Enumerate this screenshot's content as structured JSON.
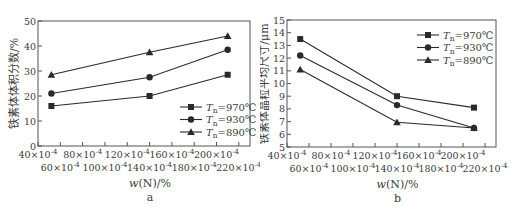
{
  "chart_data": [
    {
      "type": "line",
      "panel_label": "a",
      "title": "",
      "xlabel": "w(N)/%",
      "ylabel": "铁素体体积分数/%",
      "x_ticks": [
        "40×10⁻⁴",
        "60×10⁻⁴",
        "80×10⁻⁴",
        "100×10⁻⁴",
        "120×10⁻⁴",
        "140×10⁻⁴",
        "160×10⁻⁴",
        "180×10⁻⁴",
        "200×10⁻⁴",
        "220×10⁻⁴"
      ],
      "y_ticks": [
        "0",
        "10",
        "20",
        "30",
        "40",
        "50"
      ],
      "xlim": [
        40,
        230
      ],
      "ylim": [
        0,
        50
      ],
      "x": [
        52,
        140,
        210
      ],
      "x_unit": "×10⁻⁴",
      "series": [
        {
          "name": "Tn=970℃",
          "marker": "square",
          "values": [
            16,
            20,
            28.5
          ]
        },
        {
          "name": "Tn=930℃",
          "marker": "circle",
          "values": [
            21,
            27.5,
            38.5
          ]
        },
        {
          "name": "Tn=890℃",
          "marker": "triangle",
          "values": [
            28.5,
            37.5,
            44
          ]
        }
      ],
      "legend_position": "lower right",
      "grid": false
    },
    {
      "type": "line",
      "panel_label": "b",
      "title": "",
      "xlabel": "w(N)/%",
      "ylabel": "铁素体晶粒平均尺寸/μm",
      "x_ticks": [
        "40×10⁻⁴",
        "60×10⁻⁴",
        "80×10⁻⁴",
        "100×10⁻⁴",
        "120×10⁻⁴",
        "140×10⁻⁴",
        "160×10⁻⁴",
        "180×10⁻⁴",
        "200×10⁻⁴",
        "220×10⁻⁴"
      ],
      "y_ticks": [
        "5",
        "6",
        "7",
        "8",
        "9",
        "10",
        "11",
        "12",
        "13",
        "14",
        "15"
      ],
      "xlim": [
        40,
        230
      ],
      "ylim": [
        5,
        15
      ],
      "x": [
        52,
        140,
        210
      ],
      "x_unit": "×10⁻⁴",
      "series": [
        {
          "name": "Tn=970℃",
          "marker": "square",
          "values": [
            13.5,
            9.0,
            8.1
          ]
        },
        {
          "name": "Tn=930℃",
          "marker": "circle",
          "values": [
            12.2,
            8.3,
            6.5
          ]
        },
        {
          "name": "Tn=890℃",
          "marker": "triangle",
          "values": [
            11.1,
            6.95,
            6.5
          ]
        }
      ],
      "legend_position": "upper right",
      "grid": false
    }
  ],
  "panels": [
    {
      "label": "a",
      "ylabel": "铁素体体积分数/%",
      "xlabel": "w(N)/%",
      "legend": [
        {
          "T": "T",
          "sub": "n",
          "val": "=970℃"
        },
        {
          "T": "T",
          "sub": "n",
          "val": "=930℃"
        },
        {
          "T": "T",
          "sub": "n",
          "val": "=890℃"
        }
      ]
    },
    {
      "label": "b",
      "ylabel": "铁素体晶粒平均尺寸/μm",
      "xlabel": "w(N)/%",
      "legend": [
        {
          "T": "T",
          "sub": "n",
          "val": "=970℃"
        },
        {
          "T": "T",
          "sub": "n",
          "val": "=930℃"
        },
        {
          "T": "T",
          "sub": "n",
          "val": "=890℃"
        }
      ]
    }
  ],
  "colors": {
    "line": "#2a2a2a",
    "axis": "#555555",
    "text": "#3a3a3a"
  }
}
